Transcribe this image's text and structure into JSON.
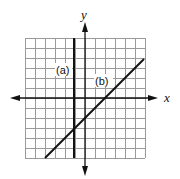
{
  "diagram": {
    "type": "coordinate-graph",
    "axes": {
      "x_label": "x",
      "y_label": "y"
    },
    "grid": {
      "cells": 12,
      "range_x": [
        -6,
        6
      ],
      "range_y": [
        -6,
        6
      ],
      "grid_color": "#9a9a9a",
      "line_color": "#111111"
    },
    "lines": [
      {
        "id": "a",
        "label": "(a)",
        "equation": "x = -1",
        "from": [
          -1,
          6
        ],
        "to": [
          -1,
          -6
        ]
      },
      {
        "id": "b",
        "label": "(b)",
        "equation": "y = x - 2",
        "from": [
          -4,
          -6
        ],
        "to": [
          6,
          4
        ]
      }
    ]
  }
}
